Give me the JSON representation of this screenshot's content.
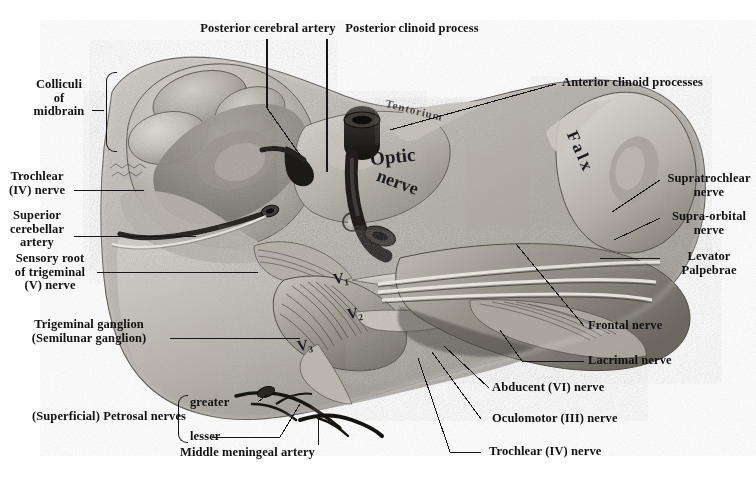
{
  "plate": {
    "title": "Dissection of the cranial base: midbrain, trigeminal ganglion, cavernous sinus and orbital nerves",
    "width": 756,
    "height": 482,
    "background_color": "#fefefe",
    "ink_color": "#15151a"
  },
  "labels": {
    "posterior_cerebral_artery": "Posterior cerebral artery",
    "posterior_clinoid_process": "Posterior clinoid process",
    "anterior_clinoid_processes": "Anterior clinoid processes",
    "colliculi_of_midbrain": "Colliculi\nof\nmidbrain",
    "trochlear_iv_nerve_left": "Trochlear\n(IV) nerve",
    "superior_cerebellar_artery": "Superior\ncerebellar\nartery",
    "sensory_root_of_trigeminal": "Sensory root\nof trigeminal\n(V) nerve",
    "trigeminal_ganglion": "Trigeminal ganglion\n(Semilunar ganglion)",
    "superficial_petrosal_nerves": "(Superficial) Petrosal nerves",
    "petrosal_greater": "greater",
    "petrosal_lesser": "lesser",
    "middle_meningeal_artery": "Middle meningeal artery",
    "supratrochlear_nerve": "Supratrochlear\nnerve",
    "supra_orbital_nerve": "Supra-orbital\nnerve",
    "levator_palpebrae": "Levator\nPalpebrae",
    "frontal_nerve": "Frontal nerve",
    "lacrimal_nerve": "Lacrimal nerve",
    "abducent_vi_nerve": "Abducent (VI) nerve",
    "oculomotor_iii_nerve": "Oculomotor (III) nerve",
    "trochlear_iv_nerve_right": "Trochlear (IV) nerve"
  },
  "in_situ_text": {
    "optic": "Optic",
    "nerve": "nerve",
    "falx": "Falx",
    "tentorium": "Tentorium",
    "v1": "V₁",
    "v2": "V₂",
    "v3": "V₃"
  }
}
